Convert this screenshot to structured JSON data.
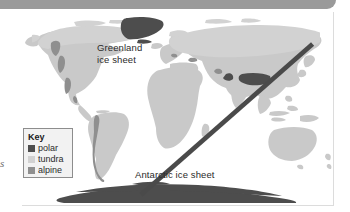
{
  "figure": {
    "type": "world-map",
    "margin_text": "s"
  },
  "map": {
    "labels": [
      {
        "id": "greenland",
        "text": "Greenland\nice sheet",
        "name": "greenland-ice-sheet-label"
      },
      {
        "id": "antarctic",
        "text": "Antarctic ice sheet",
        "name": "antarctic-ice-sheet-label"
      }
    ]
  },
  "key": {
    "title": "Key",
    "items": [
      {
        "label": "polar",
        "color": "#4d4d4d"
      },
      {
        "label": "tundra",
        "color": "#d2d2d2"
      },
      {
        "label": "alpine",
        "color": "#8f8f8f"
      }
    ]
  },
  "colors": {
    "land": "#c9c9c9",
    "polar": "#4d4d4d",
    "tundra": "#d2d2d2",
    "alpine": "#8f8f8f",
    "ocean": "#ffffff",
    "band": "#9a9a9a",
    "rule": "#dcdcdc",
    "text": "#2b2b2b"
  }
}
